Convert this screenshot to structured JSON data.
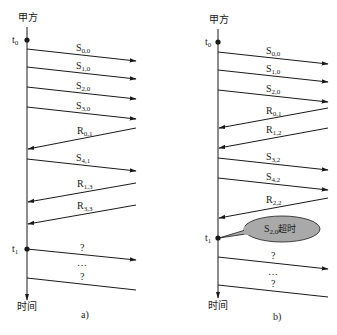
{
  "panels": [
    {
      "id": "a",
      "caption": "a)",
      "party_label": "甲方",
      "time_label": "时间",
      "axis_x": 27,
      "axis_top": 27,
      "axis_bottom": 300,
      "t0": {
        "label": "t",
        "sub": "0",
        "y": 40
      },
      "t1": {
        "label": "t",
        "sub": "1",
        "y": 249
      },
      "messages": [
        {
          "dir": "send",
          "label": "S",
          "sub": "0,0",
          "y1": 49,
          "y2": 61
        },
        {
          "dir": "send",
          "label": "S",
          "sub": "1,0",
          "y1": 67,
          "y2": 79
        },
        {
          "dir": "send",
          "label": "S",
          "sub": "2,0",
          "y1": 87,
          "y2": 99
        },
        {
          "dir": "send",
          "label": "S",
          "sub": "3,0",
          "y1": 107,
          "y2": 119
        },
        {
          "dir": "recv",
          "label": "R",
          "sub": "0,1",
          "y1": 128,
          "y2": 149
        },
        {
          "dir": "send",
          "label": "S",
          "sub": "4,1",
          "y1": 159,
          "y2": 171
        },
        {
          "dir": "recv",
          "label": "R",
          "sub": "1,3",
          "y1": 183,
          "y2": 202
        },
        {
          "dir": "recv",
          "label": "R",
          "sub": "3,3",
          "y1": 205,
          "y2": 224
        },
        {
          "dir": "send",
          "label": "?",
          "sub": "",
          "y1": 249,
          "y2": 260
        },
        {
          "dir": "send-open",
          "label": "?",
          "sub": "",
          "y1": 278,
          "y2": 290
        }
      ],
      "ellipsis": "…"
    },
    {
      "id": "b",
      "caption": "b)",
      "party_label": "甲方",
      "time_label": "时间",
      "axis_x": 218,
      "axis_top": 29,
      "axis_bottom": 298,
      "t0": {
        "label": "t",
        "sub": "0",
        "y": 42
      },
      "t1": {
        "label": "t",
        "sub": "1",
        "y": 238
      },
      "messages": [
        {
          "dir": "send",
          "label": "S",
          "sub": "0,0",
          "y1": 52,
          "y2": 64
        },
        {
          "dir": "send",
          "label": "S",
          "sub": "1,0",
          "y1": 70,
          "y2": 82
        },
        {
          "dir": "send",
          "label": "S",
          "sub": "2,0",
          "y1": 90,
          "y2": 102
        },
        {
          "dir": "recv",
          "label": "R",
          "sub": "0,1",
          "y1": 108,
          "y2": 128
        },
        {
          "dir": "recv",
          "label": "R",
          "sub": "1,2",
          "y1": 128,
          "y2": 148
        },
        {
          "dir": "send",
          "label": "S",
          "sub": "3,2",
          "y1": 158,
          "y2": 170
        },
        {
          "dir": "send",
          "label": "S",
          "sub": "4,2",
          "y1": 178,
          "y2": 190
        },
        {
          "dir": "recv",
          "label": "R",
          "sub": "2,2",
          "y1": 198,
          "y2": 218
        },
        {
          "dir": "send",
          "label": "?",
          "sub": "",
          "y1": 257,
          "y2": 269
        },
        {
          "dir": "send-open",
          "label": "?",
          "sub": "",
          "y1": 285,
          "y2": 297
        }
      ],
      "ellipsis": "…",
      "callout": {
        "label": "S",
        "sub": "2,0",
        "suffix": "超时",
        "fill": "#a9a9a9"
      }
    }
  ],
  "colors": {
    "ink": "#1a1a1a",
    "callout_fill": "#a9a9a9",
    "background": "#ffffff"
  }
}
